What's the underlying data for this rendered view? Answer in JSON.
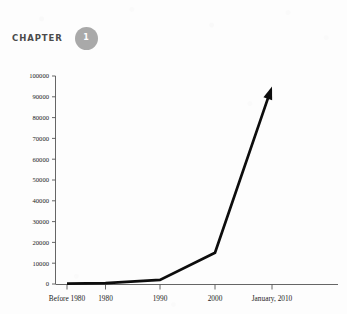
{
  "header": {
    "chapter_label": "CHAPTER",
    "chapter_number": "1",
    "badge_color": "#a9a9a9",
    "label_color": "#4b4b4b"
  },
  "chart_data": {
    "type": "line",
    "title": "",
    "xlabel": "",
    "ylabel": "",
    "categories": [
      "Before 1980",
      "1980",
      "1990",
      "2000",
      "January, 2010"
    ],
    "values": [
      200,
      400,
      2000,
      15000,
      95000
    ],
    "series": [
      {
        "name": "Growth",
        "values": [
          200,
          400,
          2000,
          15000,
          95000
        ]
      }
    ],
    "ylim": [
      0,
      100000
    ],
    "ytick_labels": [
      "0",
      "10000",
      "20000",
      "30000",
      "40000",
      "50000",
      "60000",
      "70000",
      "80000",
      "90000",
      "100000"
    ],
    "ytick_values": [
      0,
      10000,
      20000,
      30000,
      40000,
      50000,
      60000,
      70000,
      80000,
      90000,
      100000
    ],
    "xtick_labels": [
      "Before 1980",
      "1980",
      "1990",
      "2000",
      "January, 2010"
    ],
    "grid": false,
    "legend": false,
    "legend_position": "none",
    "line_color": "#0d0d0d",
    "arrow_end": true,
    "annotations": []
  }
}
